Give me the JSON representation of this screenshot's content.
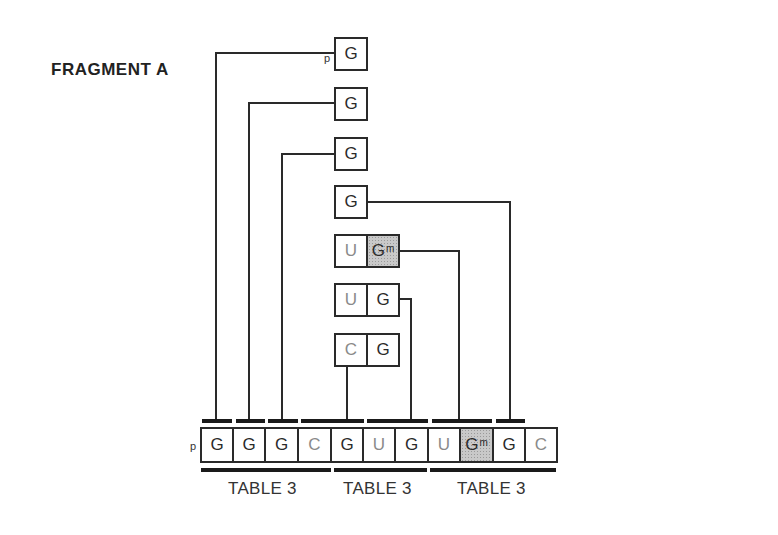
{
  "title": "FRAGMENT A",
  "phosphate_label": "p",
  "fragments": [
    {
      "id": "f1",
      "nucleotides": [
        {
          "base": "G",
          "modified": false
        }
      ],
      "phosphate": true
    },
    {
      "id": "f2",
      "nucleotides": [
        {
          "base": "G",
          "modified": false
        }
      ]
    },
    {
      "id": "f3",
      "nucleotides": [
        {
          "base": "G",
          "modified": false
        }
      ]
    },
    {
      "id": "f4",
      "nucleotides": [
        {
          "base": "G",
          "modified": false
        }
      ]
    },
    {
      "id": "f5",
      "nucleotides": [
        {
          "base": "U",
          "modified": false
        },
        {
          "base": "G",
          "modified": true,
          "mark": "m"
        }
      ]
    },
    {
      "id": "f6",
      "nucleotides": [
        {
          "base": "U",
          "modified": false
        },
        {
          "base": "G",
          "modified": false
        }
      ]
    },
    {
      "id": "f7",
      "nucleotides": [
        {
          "base": "C",
          "modified": false
        },
        {
          "base": "G",
          "modified": false
        }
      ]
    }
  ],
  "sequence": {
    "phosphate": "p",
    "bases": [
      "G",
      "G",
      "G",
      "C",
      "G",
      "U",
      "G",
      "U",
      "G",
      "G",
      "C"
    ],
    "modified_index": 8,
    "modification_mark": "m"
  },
  "table_groups": [
    {
      "label": "TABLE 3",
      "range": "G G G C"
    },
    {
      "label": "TABLE 3",
      "range": "G U G"
    },
    {
      "label": "TABLE 3",
      "range": "U Gm G C"
    }
  ],
  "colors": {
    "line": "#2a2a2a",
    "shaded": "#c9c9c9",
    "pyrimidine_text": "#8a8a8a"
  }
}
